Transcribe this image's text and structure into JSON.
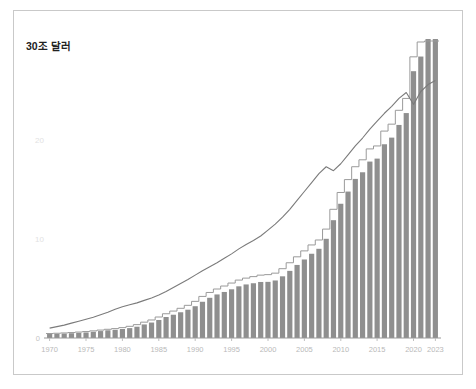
{
  "figure": {
    "title": "30조 달러",
    "background": "#ffffff",
    "border_color": "#c9c9c9"
  },
  "colors": {
    "bar": "#8f8f8f",
    "bar_gap": "#ffffff",
    "step_line": "#9a9a9a",
    "curve_line": "#7b7b7b",
    "ytick_label": "#e2e2e2",
    "xtick_label": "#b9b9b9",
    "axis": "#9a9a9a",
    "title": "#222222"
  },
  "chart_data": {
    "type": "bar",
    "title": "30조 달러",
    "xlabel": "",
    "ylabel": "",
    "ylim": [
      0,
      31
    ],
    "xlim": [
      1970,
      2023
    ],
    "grid": false,
    "legend": "none",
    "y_ticks": [
      10,
      20
    ],
    "y_tick_labels": [
      "10",
      "20"
    ],
    "zero_label": "0",
    "x_ticks": [
      1970,
      1975,
      1980,
      1985,
      1990,
      1995,
      2000,
      2005,
      2010,
      2015,
      2020,
      2023
    ],
    "x_tick_labels": [
      "1970",
      "1975",
      "1980",
      "1985",
      "1990",
      "1995",
      "2000",
      "2005",
      "2010",
      "2015",
      "2020",
      "2023"
    ],
    "categories": [
      1970,
      1971,
      1972,
      1973,
      1974,
      1975,
      1976,
      1977,
      1978,
      1979,
      1980,
      1981,
      1982,
      1983,
      1984,
      1985,
      1986,
      1987,
      1988,
      1989,
      1990,
      1991,
      1992,
      1993,
      1994,
      1995,
      1996,
      1997,
      1998,
      1999,
      2000,
      2001,
      2002,
      2003,
      2004,
      2005,
      2006,
      2007,
      2008,
      2009,
      2010,
      2011,
      2012,
      2013,
      2014,
      2015,
      2016,
      2017,
      2018,
      2019,
      2020,
      2021,
      2022,
      2023
    ],
    "series": [
      {
        "name": "bars",
        "type": "bar",
        "values": [
          0.4,
          0.42,
          0.45,
          0.48,
          0.52,
          0.56,
          0.63,
          0.7,
          0.78,
          0.83,
          0.91,
          1.0,
          1.14,
          1.37,
          1.56,
          1.82,
          2.12,
          2.35,
          2.6,
          2.86,
          3.21,
          3.66,
          4.06,
          4.4,
          4.65,
          4.92,
          5.22,
          5.41,
          5.53,
          5.66,
          5.67,
          5.81,
          6.23,
          6.78,
          7.38,
          7.93,
          8.51,
          9.01,
          10.02,
          11.9,
          13.56,
          14.79,
          16.07,
          16.74,
          17.82,
          18.12,
          19.57,
          20.24,
          21.52,
          22.72,
          26.95,
          28.43,
          30.9,
          33.2
        ],
        "bar_scale_note": "heights rendered relative to ylim"
      },
      {
        "name": "step",
        "type": "step",
        "values": [
          0.45,
          0.48,
          0.51,
          0.55,
          0.6,
          0.65,
          0.72,
          0.8,
          0.88,
          0.95,
          1.05,
          1.18,
          1.35,
          1.6,
          1.82,
          2.12,
          2.45,
          2.72,
          3.0,
          3.3,
          3.7,
          4.2,
          4.6,
          4.95,
          5.25,
          5.55,
          5.85,
          6.05,
          6.2,
          6.35,
          6.4,
          6.55,
          7.0,
          7.6,
          8.2,
          8.8,
          9.4,
          9.9,
          11.0,
          13.0,
          14.7,
          16.0,
          17.3,
          18.0,
          19.1,
          19.4,
          20.9,
          21.6,
          23.0,
          24.2,
          28.4,
          29.9,
          30.0,
          30.0
        ]
      },
      {
        "name": "curve",
        "type": "line",
        "values": [
          1.0,
          1.15,
          1.3,
          1.5,
          1.7,
          1.9,
          2.1,
          2.35,
          2.6,
          2.9,
          3.15,
          3.35,
          3.55,
          3.8,
          4.05,
          4.35,
          4.7,
          5.1,
          5.5,
          5.9,
          6.35,
          6.8,
          7.2,
          7.6,
          8.05,
          8.5,
          9.0,
          9.45,
          9.85,
          10.3,
          10.9,
          11.5,
          12.2,
          13.0,
          13.9,
          14.8,
          15.7,
          16.6,
          17.3,
          16.9,
          17.6,
          18.5,
          19.4,
          20.2,
          21.1,
          21.9,
          22.7,
          23.4,
          24.2,
          24.8,
          23.6,
          24.9,
          25.6,
          26.0
        ]
      }
    ]
  }
}
